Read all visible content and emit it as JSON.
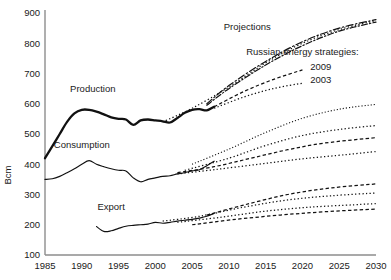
{
  "chart_data": {
    "type": "line",
    "title": "",
    "xlabel": "",
    "ylabel": "Bcm",
    "xlim": [
      1985,
      2030
    ],
    "ylim": [
      100,
      900
    ],
    "xticks": [
      1985,
      1990,
      1995,
      2000,
      2005,
      2010,
      2015,
      2020,
      2025,
      2030
    ],
    "yticks": [
      100,
      200,
      300,
      400,
      500,
      600,
      700,
      800,
      900
    ],
    "grid": false,
    "legend_position": "inline-annotations",
    "annotations": [
      {
        "text": "Production",
        "x": 1991.5,
        "y": 640
      },
      {
        "text": "Consumption",
        "x": 1990.0,
        "y": 455
      },
      {
        "text": "Export",
        "x": 1994.0,
        "y": 250
      },
      {
        "text": "Projections",
        "x": 2012.5,
        "y": 845
      },
      {
        "text": "Russian energy strategies:",
        "x": 2020.0,
        "y": 762
      },
      {
        "text": "2009",
        "x": 2022.5,
        "y": 712
      },
      {
        "text": "2003",
        "x": 2022.5,
        "y": 667
      }
    ],
    "series": [
      {
        "name": "Production historical",
        "style": "solid-thick",
        "x": [
          1985,
          1986,
          1987,
          1988,
          1989,
          1990,
          1991,
          1992,
          1993,
          1994,
          1995,
          1996,
          1997,
          1998,
          1999,
          2000,
          2001,
          2002,
          2003,
          2004,
          2005,
          2006,
          2007,
          2008
        ],
        "values": [
          420,
          460,
          500,
          540,
          568,
          580,
          580,
          574,
          565,
          555,
          550,
          548,
          530,
          545,
          548,
          545,
          542,
          538,
          553,
          570,
          580,
          582,
          578,
          590
        ]
      },
      {
        "name": "Consumption historical",
        "style": "solid-thin",
        "x": [
          1985,
          1986,
          1987,
          1988,
          1989,
          1990,
          1991,
          1992,
          1993,
          1994,
          1995,
          1996,
          1997,
          1998,
          1999,
          2000,
          2001,
          2002,
          2003,
          2004,
          2005,
          2006,
          2007,
          2008
        ],
        "values": [
          350,
          352,
          360,
          372,
          385,
          400,
          412,
          400,
          392,
          385,
          380,
          378,
          355,
          342,
          350,
          355,
          360,
          362,
          368,
          372,
          378,
          382,
          395,
          410
        ]
      },
      {
        "name": "Export historical",
        "style": "solid-thin",
        "x": [
          1992,
          1993,
          1994,
          1995,
          1996,
          1997,
          1998,
          1999,
          2000,
          2001,
          2002,
          2003,
          2004,
          2005,
          2006,
          2007,
          2008
        ],
        "values": [
          194,
          178,
          180,
          188,
          195,
          198,
          200,
          202,
          208,
          205,
          208,
          212,
          215,
          218,
          222,
          228,
          238
        ]
      },
      {
        "name": "Production projection high",
        "style": "dashdot",
        "x": [
          2007,
          2010,
          2015,
          2020,
          2025,
          2030
        ],
        "values": [
          600,
          660,
          740,
          805,
          850,
          878
        ]
      },
      {
        "name": "Production projection mid",
        "style": "dashdot2",
        "x": [
          2007,
          2010,
          2015,
          2020,
          2025,
          2030
        ],
        "values": [
          595,
          650,
          728,
          792,
          840,
          870
        ]
      },
      {
        "name": "Production projection 2003 upper",
        "style": "dot",
        "x": [
          2001,
          2005,
          2010,
          2015,
          2020,
          2025,
          2030
        ],
        "values": [
          540,
          585,
          655,
          735,
          800,
          845,
          875
        ]
      },
      {
        "name": "Production projection 2009 low",
        "style": "dash",
        "x": [
          2008,
          2012,
          2016,
          2020
        ],
        "values": [
          590,
          640,
          680,
          712
        ]
      },
      {
        "name": "Production projection 2003 low",
        "style": "dot",
        "x": [
          2008,
          2012,
          2016,
          2020
        ],
        "values": [
          585,
          622,
          650,
          668
        ]
      },
      {
        "name": "Consumption projection high",
        "style": "dotfine",
        "x": [
          2005,
          2010,
          2015,
          2020,
          2025,
          2030
        ],
        "values": [
          400,
          450,
          505,
          552,
          582,
          598
        ]
      },
      {
        "name": "Consumption projection mid",
        "style": "dot",
        "x": [
          2004,
          2010,
          2015,
          2020,
          2025,
          2030
        ],
        "values": [
          380,
          420,
          462,
          495,
          515,
          528
        ]
      },
      {
        "name": "Consumption projection low",
        "style": "dash",
        "x": [
          2003,
          2008,
          2013,
          2018,
          2023,
          2030
        ],
        "values": [
          372,
          392,
          420,
          448,
          470,
          488
        ]
      },
      {
        "name": "Consumption projection lowest",
        "style": "dot",
        "x": [
          2003,
          2008,
          2014,
          2020,
          2026,
          2030
        ],
        "values": [
          368,
          382,
          400,
          418,
          432,
          442
        ]
      },
      {
        "name": "Export projection high",
        "style": "dash",
        "x": [
          2007,
          2012,
          2018,
          2024,
          2030
        ],
        "values": [
          232,
          265,
          300,
          322,
          335
        ]
      },
      {
        "name": "Export projection mid",
        "style": "dot",
        "x": [
          2001,
          2006,
          2012,
          2018,
          2024,
          2030
        ],
        "values": [
          212,
          228,
          258,
          282,
          296,
          305
        ]
      },
      {
        "name": "Export projection low",
        "style": "dot",
        "x": [
          2003,
          2009,
          2015,
          2021,
          2027,
          2030
        ],
        "values": [
          208,
          225,
          245,
          258,
          266,
          270
        ]
      },
      {
        "name": "Export projection lowest",
        "style": "dash",
        "x": [
          2005,
          2011,
          2017,
          2023,
          2030
        ],
        "values": [
          200,
          218,
          232,
          243,
          252
        ]
      }
    ]
  }
}
